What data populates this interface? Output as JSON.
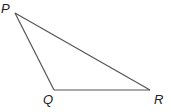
{
  "diagram": {
    "type": "triangle",
    "stroke_color": "#555555",
    "vertices": [
      {
        "name": "P",
        "label": "P",
        "x": 15,
        "y": 13,
        "label_x": 1,
        "label_y": 13
      },
      {
        "name": "Q",
        "label": "Q",
        "x": 54,
        "y": 90,
        "label_x": 43,
        "label_y": 104
      },
      {
        "name": "R",
        "label": "R",
        "x": 150,
        "y": 90,
        "label_x": 154,
        "label_y": 104
      }
    ],
    "edges": [
      {
        "name": "PQ",
        "from": "P",
        "to": "Q"
      },
      {
        "name": "QR",
        "from": "Q",
        "to": "R"
      },
      {
        "name": "PR",
        "from": "P",
        "to": "R"
      }
    ]
  }
}
